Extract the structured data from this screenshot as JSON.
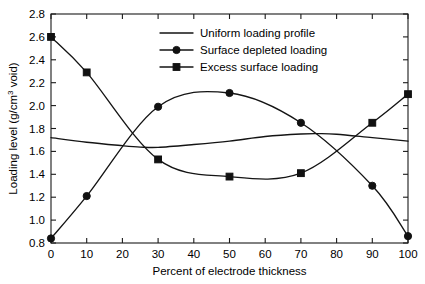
{
  "chart_data": {
    "type": "line",
    "title": "",
    "xlabel": "Percent of electrode thickness",
    "ylabel": "Loading level (g/cm3 void)",
    "ylabel_parts": {
      "prefix": "Loading level (g/cm",
      "superscript": "3",
      "suffix": " void)"
    },
    "xlim": [
      0,
      100
    ],
    "ylim": [
      0.8,
      2.8
    ],
    "xticks": [
      0,
      10,
      20,
      30,
      40,
      50,
      60,
      70,
      80,
      90,
      100
    ],
    "yticks": [
      0.8,
      1.0,
      1.2,
      1.4,
      1.6,
      1.8,
      2.0,
      2.2,
      2.4,
      2.6,
      2.8
    ],
    "xtick_labels": [
      "0",
      "10",
      "20",
      "30",
      "40",
      "50",
      "60",
      "70",
      "80",
      "90",
      "100"
    ],
    "ytick_labels": [
      "0.8",
      "1.0",
      "1.2",
      "1.4",
      "1.6",
      "1.8",
      "2.0",
      "2.2",
      "2.4",
      "2.6",
      "2.8"
    ],
    "grid": false,
    "legend_position": "top-center",
    "series": [
      {
        "name": "Uniform loading profile",
        "marker": "none",
        "color": "#141414",
        "x": [
          0,
          10,
          20,
          25,
          30,
          40,
          50,
          60,
          70,
          75,
          80,
          90,
          100
        ],
        "values": [
          1.72,
          1.68,
          1.65,
          1.638,
          1.635,
          1.66,
          1.69,
          1.73,
          1.752,
          1.755,
          1.75,
          1.72,
          1.69
        ]
      },
      {
        "name": "Surface depleted loading",
        "marker": "circle",
        "color": "#141414",
        "x": [
          0,
          10,
          30,
          50,
          70,
          90,
          100
        ],
        "values": [
          0.84,
          1.21,
          1.99,
          2.11,
          1.85,
          1.3,
          0.86
        ]
      },
      {
        "name": "Excess surface loading",
        "marker": "square",
        "color": "#141414",
        "x": [
          0,
          10,
          30,
          50,
          70,
          90,
          100
        ],
        "values": [
          2.6,
          2.29,
          1.53,
          1.38,
          1.41,
          1.85,
          2.1
        ]
      }
    ]
  },
  "legend": {
    "entries": [
      {
        "label": "Uniform loading profile",
        "marker": "none"
      },
      {
        "label": "Surface depleted loading",
        "marker": "circle"
      },
      {
        "label": "Excess surface loading",
        "marker": "square"
      }
    ]
  },
  "colors": {
    "background": "#ffffff",
    "axis": "#1a1a1a",
    "series": "#141414",
    "text": "#000000"
  }
}
